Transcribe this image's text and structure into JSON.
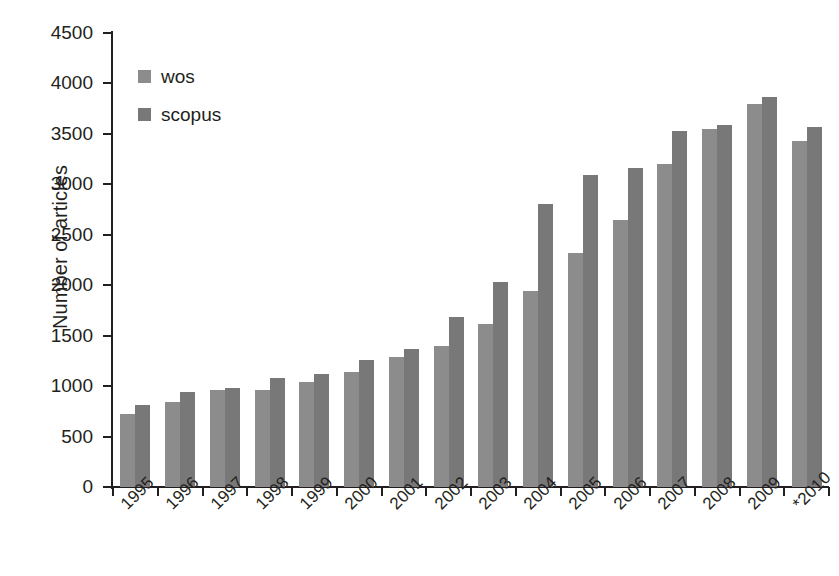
{
  "chart_data": {
    "type": "bar",
    "title": "",
    "xlabel": "",
    "ylabel": "Number of articles",
    "ylim": [
      0,
      4500
    ],
    "ytick_step": 500,
    "yticks": [
      0,
      500,
      1000,
      1500,
      2000,
      2500,
      3000,
      3500,
      4000,
      4500
    ],
    "grid": false,
    "legend_position": "top-left inside plot",
    "categories": [
      "1995",
      "1996",
      "1997",
      "1998",
      "1999",
      "2000",
      "2001",
      "2002",
      "2003",
      "2004",
      "2005",
      "2006",
      "2007",
      "2008",
      "2009",
      "*2010"
    ],
    "series": [
      {
        "name": "wos",
        "color": "#8c8c8c",
        "values": [
          720,
          840,
          965,
          965,
          1040,
          1140,
          1290,
          1395,
          1620,
          1940,
          2320,
          2650,
          3200,
          3550,
          3800,
          3430
        ]
      },
      {
        "name": "scopus",
        "color": "#787878",
        "values": [
          810,
          940,
          985,
          1085,
          1125,
          1255,
          1370,
          1690,
          2035,
          2810,
          3090,
          3160,
          3530,
          3590,
          3870,
          3570
        ]
      }
    ]
  },
  "axes": {
    "y_title": "Number of articles"
  },
  "legend": {
    "items": [
      {
        "label": "wos",
        "color": "#8c8c8c"
      },
      {
        "label": "scopus",
        "color": "#787878"
      }
    ]
  }
}
